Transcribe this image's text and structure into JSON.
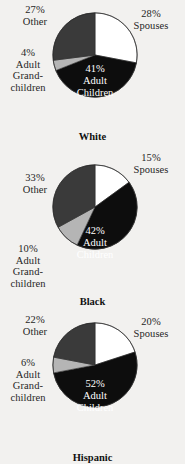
{
  "figure": {
    "background_color": "#f2f1ef",
    "slice_colors": {
      "spouses": "#ffffff",
      "adult_children": "#0d0d0d",
      "adult_grandchildren": "#b5b5b5",
      "other": "#3a3a3a"
    }
  },
  "charts": [
    {
      "title": "White",
      "labels": {
        "spouses_pct": "28%",
        "spouses_name": "Spouses",
        "children_pct": "41%",
        "children_name_1": "Adult",
        "children_name_2": "Children",
        "grandchildren_pct": "4%",
        "grandchildren_name_1": "Adult",
        "grandchildren_name_2": "Grand-",
        "grandchildren_name_3": "children",
        "other_pct": "27%",
        "other_name": "Other"
      }
    },
    {
      "title": "Black",
      "labels": {
        "spouses_pct": "15%",
        "spouses_name": "Spouses",
        "children_pct": "42%",
        "children_name_1": "Adult",
        "children_name_2": "Children",
        "grandchildren_pct": "10%",
        "grandchildren_name_1": "Adult",
        "grandchildren_name_2": "Grand-",
        "grandchildren_name_3": "children",
        "other_pct": "33%",
        "other_name": "Other"
      }
    },
    {
      "title": "Hispanic",
      "labels": {
        "spouses_pct": "20%",
        "spouses_name": "Spouses",
        "children_pct": "52%",
        "children_name_1": "Adult",
        "children_name_2": "Children",
        "grandchildren_pct": "6%",
        "grandchildren_name_1": "Adult",
        "grandchildren_name_2": "Grand-",
        "grandchildren_name_3": "children",
        "other_pct": "22%",
        "other_name": "Other"
      }
    }
  ],
  "chart_data": [
    {
      "type": "pie",
      "title": "White",
      "categories": [
        "Spouses",
        "Adult Children",
        "Adult Grandchildren",
        "Other"
      ],
      "values": [
        28,
        41,
        4,
        27
      ],
      "colors": [
        "#ffffff",
        "#0d0d0d",
        "#b5b5b5",
        "#3a3a3a"
      ],
      "units": "percent",
      "start_angle_deg": 0,
      "direction": "clockwise",
      "legend": "none",
      "labels_inline": true
    },
    {
      "type": "pie",
      "title": "Black",
      "categories": [
        "Spouses",
        "Adult Children",
        "Adult Grandchildren",
        "Other"
      ],
      "values": [
        15,
        42,
        10,
        33
      ],
      "colors": [
        "#ffffff",
        "#0d0d0d",
        "#b5b5b5",
        "#3a3a3a"
      ],
      "units": "percent",
      "start_angle_deg": 0,
      "direction": "clockwise",
      "legend": "none",
      "labels_inline": true
    },
    {
      "type": "pie",
      "title": "Hispanic",
      "categories": [
        "Spouses",
        "Adult Children",
        "Adult Grandchildren",
        "Other"
      ],
      "values": [
        20,
        52,
        6,
        22
      ],
      "colors": [
        "#ffffff",
        "#0d0d0d",
        "#b5b5b5",
        "#3a3a3a"
      ],
      "units": "percent",
      "start_angle_deg": 0,
      "direction": "clockwise",
      "legend": "none",
      "labels_inline": true
    }
  ]
}
